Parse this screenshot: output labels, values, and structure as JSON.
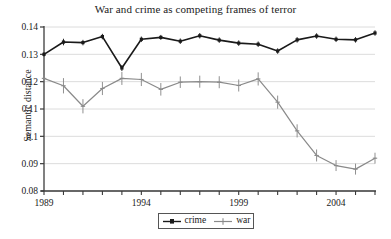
{
  "chart_data": {
    "type": "line",
    "title": "War and crime as competing frames of terror",
    "xlabel": "",
    "ylabel": "Semantic distance",
    "grid": true,
    "legend_position": "bottom-center",
    "xlim": [
      1989,
      2006
    ],
    "ylim": [
      0.08,
      0.14
    ],
    "ytick_labels": [
      "0.08",
      "0.09",
      "0.1",
      "0.11",
      "0.12",
      "0.13",
      "0.14"
    ],
    "ytick_values": [
      0.08,
      0.09,
      0.1,
      0.11,
      0.12,
      0.13,
      0.14
    ],
    "xtick_values": [
      1989,
      1990,
      1991,
      1992,
      1993,
      1994,
      1995,
      1996,
      1997,
      1998,
      1999,
      2000,
      2001,
      2002,
      2003,
      2004,
      2005,
      2006
    ],
    "xtick_labels_shown": [
      "1989",
      "1994",
      "1999",
      "2004"
    ],
    "xtick_labeled_values": [
      1989,
      1994,
      1999,
      2004
    ],
    "x": [
      1989,
      1990,
      1991,
      1992,
      1993,
      1994,
      1995,
      1996,
      1997,
      1998,
      1999,
      2000,
      2001,
      2002,
      2003,
      2004,
      2005,
      2006
    ],
    "series": [
      {
        "name": "crime",
        "color": "#1a1a1a",
        "values": [
          0.13,
          0.1345,
          0.1343,
          0.1365,
          0.125,
          0.1355,
          0.1362,
          0.1348,
          0.1368,
          0.1352,
          0.1341,
          0.1337,
          0.1312,
          0.1353,
          0.1367,
          0.1355,
          0.1353,
          0.1378
        ],
        "errors": [
          0.0008,
          0.0012,
          0.001,
          0.001,
          0.0011,
          0.001,
          0.0009,
          0.001,
          0.001,
          0.001,
          0.001,
          0.001,
          0.001,
          0.001,
          0.001,
          0.001,
          0.001,
          0.001
        ]
      },
      {
        "name": "war",
        "color": "#8a8a8a",
        "values": [
          0.1212,
          0.1185,
          0.111,
          0.1175,
          0.1212,
          0.1208,
          0.1172,
          0.1198,
          0.12,
          0.1198,
          0.1186,
          0.121,
          0.1125,
          0.102,
          0.093,
          0.0893,
          0.088,
          0.092
        ],
        "errors": [
          0.0012,
          0.0028,
          0.0026,
          0.0024,
          0.0024,
          0.0024,
          0.0023,
          0.0021,
          0.0022,
          0.0022,
          0.0022,
          0.0024,
          0.0024,
          0.0024,
          0.0022,
          0.002,
          0.002,
          0.002
        ]
      }
    ]
  },
  "legend": {
    "items": [
      {
        "label": "crime",
        "color": "#1a1a1a"
      },
      {
        "label": "war",
        "color": "#8a8a8a"
      }
    ]
  }
}
